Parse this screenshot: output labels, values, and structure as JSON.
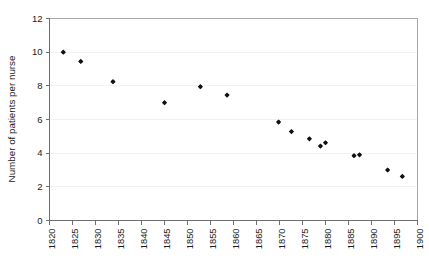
{
  "chart_data": {
    "type": "scatter",
    "title": "",
    "xlabel": "",
    "ylabel": "Number of patients per nurse",
    "xlim": [
      1820,
      1900
    ],
    "ylim": [
      0,
      12
    ],
    "xticks": [
      1820,
      1825,
      1830,
      1835,
      1840,
      1845,
      1850,
      1855,
      1860,
      1865,
      1870,
      1875,
      1880,
      1885,
      1890,
      1895,
      1900
    ],
    "yticks": [
      0,
      2,
      4,
      6,
      8,
      10,
      12
    ],
    "xtick_labels": [
      "1820",
      "1825",
      "1830",
      "1835",
      "1840",
      "1845",
      "1850",
      "1855",
      "1860",
      "1865",
      "1870",
      "1875",
      "1880",
      "1885",
      "1890",
      "1895",
      "1900"
    ],
    "ytick_labels": [
      "0",
      "2",
      "4",
      "6",
      "8",
      "10",
      "12"
    ],
    "grid": true,
    "grid_axis": "y",
    "legend": false,
    "marker": "diamond",
    "marker_color": "#111111",
    "series": [
      {
        "name": "Patients per nurse",
        "points": [
          {
            "x": 1823.0,
            "y": 10.0
          },
          {
            "x": 1826.8,
            "y": 9.45
          },
          {
            "x": 1833.8,
            "y": 8.25
          },
          {
            "x": 1845.0,
            "y": 7.0
          },
          {
            "x": 1852.8,
            "y": 7.95
          },
          {
            "x": 1858.6,
            "y": 7.45
          },
          {
            "x": 1869.8,
            "y": 5.85
          },
          {
            "x": 1872.6,
            "y": 5.28
          },
          {
            "x": 1876.5,
            "y": 4.85
          },
          {
            "x": 1878.9,
            "y": 4.42
          },
          {
            "x": 1880.0,
            "y": 4.62
          },
          {
            "x": 1886.2,
            "y": 3.85
          },
          {
            "x": 1887.4,
            "y": 3.9
          },
          {
            "x": 1893.5,
            "y": 3.0
          },
          {
            "x": 1896.7,
            "y": 2.62
          }
        ]
      }
    ]
  },
  "axes": {
    "y_axis_title": "Number of patients per nurse"
  }
}
